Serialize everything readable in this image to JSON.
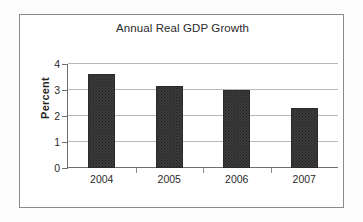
{
  "figure": {
    "background_color": "#fdfdfd",
    "frame_color": "#8a8a8a"
  },
  "chart_data": {
    "type": "bar",
    "title": "Annual Real GDP Growth",
    "xlabel": "",
    "ylabel": "Percent",
    "categories": [
      "2004",
      "2005",
      "2006",
      "2007"
    ],
    "values": [
      3.63,
      3.15,
      3.0,
      2.3
    ],
    "series": [
      {
        "name": "Annual Real GDP Growth",
        "values": [
          3.63,
          3.15,
          3.0,
          2.3
        ],
        "color": "#3c3c3c"
      }
    ],
    "ylim": [
      0,
      4
    ],
    "ytick_labels": [
      "0",
      "1",
      "2",
      "3",
      "4"
    ],
    "ytick_values": [
      0,
      1,
      2,
      3,
      4
    ],
    "grid": true,
    "grid_axis": "y",
    "grid_color": "#b9b9b9",
    "legend": false,
    "legend_position": "none",
    "bar_color": "#3c3c3c",
    "bar_edge_color": "#2a2a2a"
  }
}
